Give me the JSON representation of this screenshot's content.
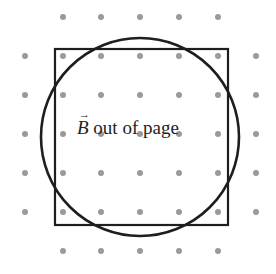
{
  "diagram": {
    "label": {
      "symbol": "B",
      "vector_arrow": "→",
      "text": " out of page"
    },
    "field_direction": "out-of-page",
    "colors": {
      "dots": "#9a9a9a",
      "lines": "#1e1e1e",
      "background": "#ffffff"
    },
    "grid": {
      "dot_radius": 3,
      "rows": [
        {
          "y": 17,
          "xs": [
            63,
            101,
            140,
            179,
            218
          ]
        },
        {
          "y": 56,
          "xs": [
            25,
            63,
            101,
            140,
            179,
            218,
            256
          ]
        },
        {
          "y": 95,
          "xs": [
            25,
            63,
            101,
            140,
            179,
            218,
            256
          ]
        },
        {
          "y": 134,
          "xs": [
            25,
            63,
            101,
            140,
            179,
            218,
            256
          ]
        },
        {
          "y": 173,
          "xs": [
            25,
            63,
            101,
            140,
            179,
            218,
            256
          ]
        },
        {
          "y": 212,
          "xs": [
            25,
            63,
            101,
            140,
            179,
            218,
            256
          ]
        },
        {
          "y": 251,
          "xs": [
            63,
            101,
            140,
            179,
            218
          ]
        }
      ]
    },
    "square": {
      "x": 55,
      "y": 49,
      "width": 173,
      "height": 176,
      "stroke_width": 2.2
    },
    "circle": {
      "cx": 140,
      "cy": 137,
      "r": 99,
      "stroke_width": 2.6
    }
  }
}
